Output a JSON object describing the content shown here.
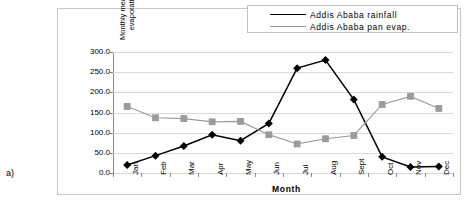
{
  "figure": {
    "panel_label": "a)"
  },
  "chart_data": {
    "type": "line",
    "title": "",
    "subtitle": "",
    "xlabel": "Month",
    "ylabel": "Monthly mean rainfall/pan evaporation (in mm)",
    "ylabel_line1": "Monthly mean rainfall/pan",
    "ylabel_line2": "evaporation (in mm)",
    "categories": [
      "Jan",
      "Feb",
      "Mar",
      "Apr",
      "May",
      "Jun",
      "Jul",
      "Aug",
      "Sept",
      "Oct",
      "Nov",
      "Dec"
    ],
    "ylim": [
      0,
      300
    ],
    "ytick_step": 50,
    "ytick_labels": [
      "300.0",
      "250.0",
      "200.0",
      "150.0",
      "100.0",
      "50.0",
      "0.0"
    ],
    "ytick_values": [
      300,
      250,
      200,
      150,
      100,
      50,
      0
    ],
    "grid": true,
    "legend_position": "top-right",
    "series": [
      {
        "name": "Addis Ababa rainfall",
        "color": "#000000",
        "marker": "diamond",
        "values": [
          20,
          43,
          67,
          95,
          80,
          123,
          260,
          280,
          182,
          40,
          15,
          16
        ]
      },
      {
        "name": "Addis Ababa pan evap.",
        "color": "#9b9b9b",
        "marker": "square",
        "values": [
          165,
          137,
          135,
          127,
          128,
          95,
          72,
          85,
          93,
          170,
          190,
          160
        ]
      }
    ]
  }
}
